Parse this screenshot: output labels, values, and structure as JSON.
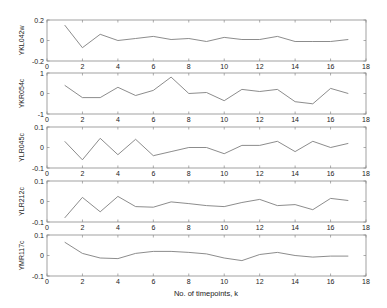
{
  "chart_data": {
    "type": "line",
    "layout": "5 vertically stacked subplots, shared x axis",
    "xlabel": "No. of timepoints, k",
    "xlim": [
      0,
      18
    ],
    "xticks": [
      0,
      2,
      4,
      6,
      8,
      10,
      12,
      14,
      16,
      18
    ],
    "grid": false,
    "line_color": "#7f7f7f",
    "x": [
      1,
      2,
      3,
      4,
      5,
      6,
      7,
      8,
      9,
      10,
      11,
      12,
      13,
      14,
      15,
      16,
      17
    ],
    "panels": [
      {
        "ylabel": "YKL042w",
        "ylim": [
          -0.2,
          0.2
        ],
        "yticks": [
          -0.2,
          0,
          0.2
        ],
        "ytick_labels": [
          "-0.2",
          "0",
          "0.2"
        ],
        "values": [
          0.15,
          -0.07,
          0.06,
          0.0,
          0.02,
          0.04,
          0.01,
          0.02,
          -0.01,
          0.03,
          0.01,
          0.01,
          0.04,
          -0.01,
          -0.01,
          -0.01,
          0.01
        ]
      },
      {
        "ylabel": "YKR054c",
        "ylim": [
          -1,
          1
        ],
        "yticks": [
          -1,
          0,
          1
        ],
        "ytick_labels": [
          "-1",
          "0",
          "1"
        ],
        "values": [
          0.4,
          -0.2,
          -0.2,
          0.3,
          -0.1,
          0.15,
          0.8,
          0.0,
          0.05,
          -0.35,
          0.2,
          0.1,
          0.2,
          -0.4,
          -0.5,
          0.25,
          0.0
        ]
      },
      {
        "ylabel": "YLR045c",
        "ylim": [
          -0.1,
          0.1
        ],
        "yticks": [
          -0.1,
          0,
          0.1
        ],
        "ytick_labels": [
          "-0.1",
          "0",
          "0.1"
        ],
        "values": [
          0.03,
          -0.06,
          0.045,
          -0.035,
          0.04,
          -0.04,
          -0.02,
          0.0,
          0.0,
          -0.03,
          0.01,
          0.01,
          0.03,
          -0.02,
          0.03,
          0.0,
          0.02
        ]
      },
      {
        "ylabel": "YLR212c",
        "ylim": [
          -0.1,
          0.1
        ],
        "yticks": [
          -0.1,
          0,
          0.1
        ],
        "ytick_labels": [
          "-0.1",
          "0",
          "0.1"
        ],
        "values": [
          -0.08,
          0.02,
          -0.05,
          0.025,
          -0.025,
          -0.028,
          -0.002,
          -0.01,
          -0.02,
          -0.025,
          -0.005,
          0.01,
          -0.02,
          -0.015,
          -0.04,
          0.015,
          0.005
        ]
      },
      {
        "ylabel": "YMR117c",
        "ylim": [
          -0.1,
          0.1
        ],
        "yticks": [
          -0.1,
          0,
          0.1
        ],
        "ytick_labels": [
          "-0.1",
          "0",
          "0.1"
        ],
        "values": [
          0.065,
          0.01,
          -0.012,
          -0.015,
          0.01,
          0.02,
          0.02,
          0.015,
          0.008,
          -0.012,
          -0.025,
          0.005,
          0.015,
          0.0,
          -0.008,
          -0.003,
          -0.003
        ]
      }
    ]
  }
}
